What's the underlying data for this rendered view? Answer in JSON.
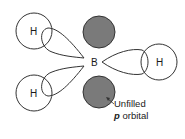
{
  "diagram": {
    "title": "",
    "central_atom": {
      "label": "B"
    },
    "hydrogens": [
      {
        "label": "H",
        "position": "upper-left"
      },
      {
        "label": "H",
        "position": "lower-left"
      },
      {
        "label": "H",
        "position": "right"
      }
    ],
    "annotation": {
      "line1": "Unfilled",
      "line2_italic": "p",
      "line2_rest": " orbital"
    },
    "colors": {
      "stroke": "#333333",
      "p_orbital_fill": "#7a7a7a",
      "background": "#ffffff"
    }
  }
}
